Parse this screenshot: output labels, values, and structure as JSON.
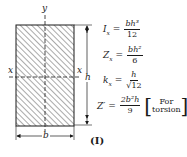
{
  "figure": {
    "caption": "(I)",
    "axis_labels": {
      "y_top": "y",
      "x_left": "x",
      "x_right": "x"
    },
    "dimensions": {
      "height": "h",
      "width": "b"
    },
    "hatch_color": "#555555",
    "line_color": "#1a1a1a"
  },
  "equations": [
    {
      "lhs": "I",
      "sub": "x",
      "eq": "=",
      "num": "bh³",
      "den": "12"
    },
    {
      "lhs": "Z",
      "sub": "x",
      "eq": "=",
      "num": "bh²",
      "den": "6"
    },
    {
      "lhs": "k",
      "sub": "x",
      "eq": "=",
      "num": "h",
      "den": "√12"
    },
    {
      "lhs": "Z′",
      "sub": "",
      "eq": "=",
      "num": "2b²h",
      "den": "9",
      "note_line1": "For",
      "note_line2": "torsion"
    }
  ]
}
